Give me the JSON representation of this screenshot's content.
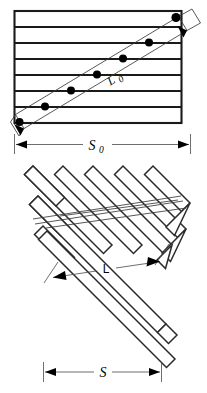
{
  "figure": {
    "panels": [
      {
        "id": "panel-top",
        "name": "undeformed-lamellar-stack",
        "description": "Rectangle subdivided into seven horizontal layers crossed by a diagonal band; filled circles mark the intersections of the diagonal with each layer boundary.",
        "layer_count": 7,
        "interior_line_count": 6,
        "marker_count": 7,
        "labels": {
          "diagonal_label": "L",
          "diagonal_label_subscript": "0",
          "width_label": "S",
          "width_label_subscript": "0"
        }
      },
      {
        "id": "panel-bottom",
        "name": "folded-chevron-stack",
        "description": "Accordion-folded ribbon made of five parallel diagonal strips joined by zig-zag folds.",
        "strip_count": 5,
        "labels": {
          "length_label": "L",
          "width_label": "S"
        }
      }
    ],
    "dimension_lines": [
      {
        "name": "s0-dimension",
        "label": "S",
        "subscript": "0",
        "orientation": "horizontal",
        "arrow_style": "double-ended-with-extension-ticks"
      },
      {
        "name": "s-dimension",
        "label": "S",
        "subscript": "",
        "orientation": "horizontal",
        "arrow_style": "double-ended-with-extension-ticks"
      },
      {
        "name": "l0-leader",
        "label": "L",
        "subscript": "0",
        "orientation": "diagonal",
        "arrow_style": "double-ended"
      },
      {
        "name": "l-dimension",
        "label": "L",
        "subscript": "",
        "orientation": "diagonal",
        "arrow_style": "double-ended-with-extension-ticks"
      }
    ],
    "colors": {
      "ink": "#1a1a1a",
      "thin_ink": "#3a3a3a",
      "paper": "#ffffff",
      "marker": "#000000"
    }
  }
}
